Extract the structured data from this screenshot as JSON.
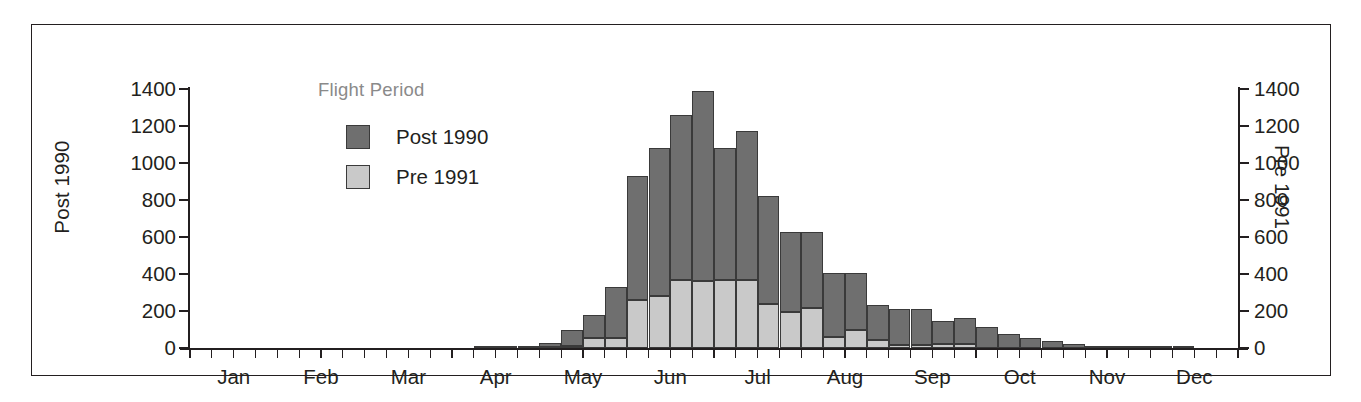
{
  "chart_data": {
    "type": "bar",
    "subtype": "stacked-histogram",
    "title": "",
    "xlabel": "",
    "ylabel_left": "Post 1990",
    "ylabel_right": "Pre 1991",
    "ylim": [
      0,
      1400
    ],
    "ytick_labels": [
      "1400",
      "1200",
      "1000",
      "800",
      "600",
      "400",
      "200",
      "0"
    ],
    "ytick_values": [
      1400,
      1200,
      1000,
      800,
      600,
      400,
      200,
      0
    ],
    "grid": false,
    "legend_title": "Flight Period",
    "legend_position": "inside-upper-left",
    "x_month_labels": [
      "Jan",
      "Feb",
      "Mar",
      "Apr",
      "May",
      "Jun",
      "Jul",
      "Aug",
      "Sep",
      "Oct",
      "Nov",
      "Dec"
    ],
    "x_ticks_per_month": 4,
    "x_total_intervals": 48,
    "colors": {
      "post_1990": "#6f6f6f",
      "pre_1991": "#c9c9c9",
      "outline": "#3a3a3a",
      "axis": "#231f20",
      "legend_title": "#8a8a8a",
      "background": "#ffffff"
    },
    "series": [
      {
        "name": "Post 1990",
        "color_key": "post_1990",
        "values": [
          0,
          0,
          0,
          0,
          0,
          0,
          0,
          0,
          0,
          0,
          0,
          0,
          0,
          2,
          3,
          5,
          25,
          90,
          125,
          275,
          670,
          800,
          890,
          1030,
          715,
          805,
          580,
          430,
          410,
          345,
          310,
          190,
          195,
          195,
          125,
          140,
          115,
          75,
          55,
          40,
          20,
          10,
          6,
          4,
          2,
          1,
          0,
          0
        ]
      },
      {
        "name": "Pre 1991",
        "color_key": "pre_1991",
        "values": [
          0,
          0,
          0,
          0,
          0,
          0,
          0,
          0,
          0,
          0,
          0,
          0,
          0,
          0,
          0,
          0,
          3,
          10,
          55,
          55,
          260,
          280,
          370,
          360,
          365,
          370,
          240,
          195,
          215,
          60,
          95,
          45,
          15,
          15,
          20,
          20,
          0,
          0,
          0,
          0,
          0,
          0,
          0,
          0,
          0,
          0,
          0,
          0
        ]
      }
    ],
    "totals": [
      0,
      0,
      0,
      0,
      0,
      0,
      0,
      0,
      0,
      0,
      0,
      0,
      0,
      2,
      3,
      5,
      28,
      100,
      180,
      330,
      930,
      1080,
      1260,
      1390,
      1080,
      1175,
      820,
      625,
      625,
      405,
      405,
      235,
      210,
      210,
      145,
      160,
      115,
      75,
      55,
      40,
      20,
      10,
      6,
      4,
      2,
      1,
      0,
      0
    ]
  },
  "axes": {
    "left_title": "Post 1990",
    "right_title": "Pre 1991"
  },
  "legend": {
    "title": "Flight Period",
    "items": [
      {
        "label": "Post 1990",
        "swatch": "post_1990"
      },
      {
        "label": "Pre 1991",
        "swatch": "pre_1991"
      }
    ]
  }
}
